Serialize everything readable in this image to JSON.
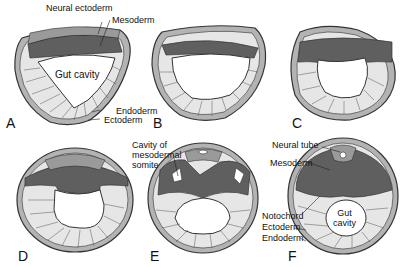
{
  "figure": {
    "colors": {
      "ectoderm": "#b3b3b3",
      "neural_ectoderm": "#9a9a9a",
      "mesoderm": "#5f5f5f",
      "endoderm": "#e6e6e6",
      "outline": "#333333",
      "cavity": "#ffffff"
    },
    "panels": [
      {
        "letter": "A"
      },
      {
        "letter": "B"
      },
      {
        "letter": "C"
      },
      {
        "letter": "D"
      },
      {
        "letter": "E"
      },
      {
        "letter": "F"
      }
    ],
    "labels": {
      "neural_ectoderm": "Neural ectoderm",
      "mesoderm_a": "Mesoderm",
      "gut_cavity_a": "Gut cavity",
      "endoderm_a": "Endoderm",
      "ectoderm_a": "Ectoderm",
      "cavity_somite": "Cavity of\nmesodermal\nsomite",
      "neural_tube": "Neural tube",
      "mesoderm_f": "Mesoderm",
      "notochord": "Notochord",
      "ectoderm_f": "Ectoderm",
      "endoderm_f": "Endoderm",
      "gut_cavity_f": "Gut\ncavity"
    }
  }
}
